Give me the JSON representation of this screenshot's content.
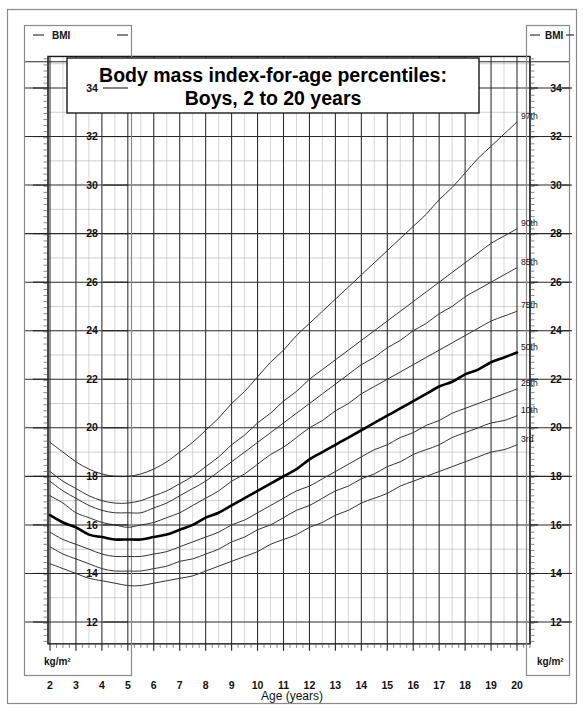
{
  "page": {
    "title_line_1": "Body mass index-for-age percentiles:",
    "title_line_2": "Boys, 2 to 20 years"
  },
  "axes": {
    "y_unit_top_left": "BMI",
    "y_unit_top_right": "BMI",
    "y_unit_bottom_left": "kg/m²",
    "y_unit_bottom_right": "kg/m²",
    "x_axis_title": "Age (years)",
    "y_tick_labels": [
      "34",
      "32",
      "30",
      "28",
      "26",
      "24",
      "22",
      "20",
      "18",
      "16",
      "14",
      "12"
    ],
    "x_tick_labels": [
      "2",
      "3",
      "4",
      "5",
      "6",
      "7",
      "8",
      "9",
      "10",
      "11",
      "12",
      "13",
      "14",
      "15",
      "16",
      "17",
      "18",
      "19",
      "20"
    ]
  },
  "legend": {
    "percentile_labels": [
      "97th",
      "90th",
      "85th",
      "75th",
      "50th",
      "25th",
      "10th",
      "3rd"
    ]
  },
  "colors": {
    "background": "#ffffff",
    "grid_major": "#2a2a2a",
    "grid_minor": "#b9b9b9",
    "curve": "#333333",
    "curve_median": "#000000",
    "frame": "#1a1a1a",
    "text": "#111111"
  },
  "chart_data": {
    "type": "line",
    "xlabel": "Age (years)",
    "ylabel": "BMI (kg/m²)",
    "xlim": [
      2,
      20.5
    ],
    "ylim": [
      11,
      35.2
    ],
    "xticks": [
      2,
      3,
      4,
      5,
      6,
      7,
      8,
      9,
      10,
      11,
      12,
      13,
      14,
      15,
      16,
      17,
      18,
      19,
      20
    ],
    "yticks": [
      12,
      14,
      16,
      18,
      20,
      22,
      24,
      26,
      28,
      30,
      32,
      34
    ],
    "grid": true,
    "grid_minor_x_step": 0.5,
    "grid_minor_y_step": 1,
    "legend_position": "right-inline-curve-ends",
    "x": [
      2,
      2.5,
      3,
      3.5,
      4,
      4.5,
      5,
      5.5,
      6,
      6.5,
      7,
      7.5,
      8,
      8.5,
      9,
      9.5,
      10,
      10.5,
      11,
      11.5,
      12,
      12.5,
      13,
      13.5,
      14,
      14.5,
      15,
      15.5,
      16,
      16.5,
      17,
      17.5,
      18,
      18.5,
      19,
      19.5,
      20
    ],
    "series": [
      {
        "name": "97th",
        "label": "97th",
        "emphasis": false,
        "values": [
          19.4,
          19.0,
          18.6,
          18.3,
          18.1,
          18.0,
          18.0,
          18.1,
          18.3,
          18.6,
          19.0,
          19.4,
          19.9,
          20.4,
          21.0,
          21.5,
          22.1,
          22.7,
          23.2,
          23.8,
          24.3,
          24.8,
          25.3,
          25.8,
          26.3,
          26.8,
          27.3,
          27.8,
          28.3,
          28.8,
          29.4,
          29.9,
          30.5,
          31.1,
          31.6,
          32.1,
          32.6
        ]
      },
      {
        "name": "90th",
        "label": "90th",
        "emphasis": false,
        "values": [
          18.2,
          17.8,
          17.5,
          17.2,
          17.0,
          16.9,
          16.9,
          17.0,
          17.2,
          17.4,
          17.7,
          18.0,
          18.4,
          18.8,
          19.3,
          19.7,
          20.2,
          20.6,
          21.1,
          21.5,
          22.0,
          22.4,
          22.8,
          23.2,
          23.6,
          24.0,
          24.4,
          24.8,
          25.2,
          25.6,
          26.0,
          26.4,
          26.8,
          27.2,
          27.6,
          27.9,
          28.2
        ]
      },
      {
        "name": "85th",
        "label": "85th",
        "emphasis": false,
        "values": [
          17.8,
          17.4,
          17.1,
          16.8,
          16.6,
          16.5,
          16.5,
          16.5,
          16.7,
          16.9,
          17.2,
          17.5,
          17.8,
          18.2,
          18.6,
          19.0,
          19.4,
          19.8,
          20.2,
          20.6,
          21.0,
          21.4,
          21.8,
          22.2,
          22.6,
          22.9,
          23.3,
          23.6,
          24.0,
          24.3,
          24.7,
          25.0,
          25.4,
          25.7,
          26.0,
          26.3,
          26.6
        ]
      },
      {
        "name": "75th",
        "label": "75th",
        "emphasis": false,
        "values": [
          17.2,
          16.9,
          16.5,
          16.3,
          16.1,
          16.0,
          15.9,
          16.0,
          16.1,
          16.3,
          16.5,
          16.8,
          17.1,
          17.4,
          17.8,
          18.1,
          18.5,
          18.9,
          19.2,
          19.6,
          20.0,
          20.3,
          20.7,
          21.0,
          21.4,
          21.7,
          22.0,
          22.3,
          22.6,
          22.9,
          23.2,
          23.5,
          23.8,
          24.1,
          24.4,
          24.6,
          24.8
        ]
      },
      {
        "name": "50th",
        "label": "50th",
        "emphasis": true,
        "values": [
          16.4,
          16.1,
          15.9,
          15.6,
          15.5,
          15.4,
          15.4,
          15.4,
          15.5,
          15.6,
          15.8,
          16.0,
          16.3,
          16.5,
          16.8,
          17.1,
          17.4,
          17.7,
          18.0,
          18.3,
          18.7,
          19.0,
          19.3,
          19.6,
          19.9,
          20.2,
          20.5,
          20.8,
          21.1,
          21.4,
          21.7,
          21.9,
          22.2,
          22.4,
          22.7,
          22.9,
          23.1
        ]
      },
      {
        "name": "25th",
        "label": "25th",
        "emphasis": false,
        "values": [
          15.7,
          15.4,
          15.2,
          15.0,
          14.8,
          14.7,
          14.7,
          14.7,
          14.8,
          14.9,
          15.1,
          15.3,
          15.5,
          15.7,
          16.0,
          16.2,
          16.5,
          16.8,
          17.1,
          17.4,
          17.6,
          17.9,
          18.2,
          18.5,
          18.8,
          19.1,
          19.3,
          19.6,
          19.8,
          20.1,
          20.3,
          20.6,
          20.8,
          21.0,
          21.2,
          21.4,
          21.6
        ]
      },
      {
        "name": "10th",
        "label": "10th",
        "emphasis": false,
        "values": [
          15.1,
          14.8,
          14.6,
          14.4,
          14.2,
          14.1,
          14.1,
          14.1,
          14.2,
          14.3,
          14.5,
          14.6,
          14.8,
          15.0,
          15.3,
          15.5,
          15.8,
          16.0,
          16.3,
          16.6,
          16.8,
          17.1,
          17.4,
          17.6,
          17.9,
          18.1,
          18.4,
          18.6,
          18.9,
          19.1,
          19.3,
          19.6,
          19.8,
          20.0,
          20.2,
          20.3,
          20.5
        ]
      },
      {
        "name": "3rd",
        "label": "3rd",
        "emphasis": false,
        "values": [
          14.4,
          14.2,
          14.0,
          13.8,
          13.7,
          13.6,
          13.5,
          13.5,
          13.6,
          13.7,
          13.8,
          13.9,
          14.1,
          14.3,
          14.5,
          14.7,
          14.9,
          15.2,
          15.4,
          15.6,
          15.9,
          16.1,
          16.4,
          16.6,
          16.9,
          17.1,
          17.3,
          17.6,
          17.8,
          18.0,
          18.2,
          18.4,
          18.6,
          18.8,
          19.0,
          19.1,
          19.3
        ]
      }
    ]
  }
}
